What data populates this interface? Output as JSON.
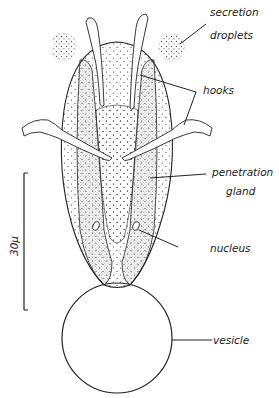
{
  "figure": {
    "labels": {
      "secretion_droplets_line1": "secretion",
      "secretion_droplets_line2": "droplets",
      "hooks": "hooks",
      "penetration_gland_line1": "penetration",
      "penetration_gland_line2": "gland",
      "nucleus": "nucleus",
      "vesicle": "vesicle"
    },
    "scale_bar": {
      "label": "30μ"
    },
    "colors": {
      "ink": "#222222",
      "background": "#ffffff"
    }
  }
}
